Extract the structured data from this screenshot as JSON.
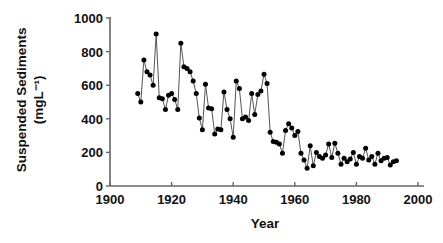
{
  "chart_data": {
    "type": "line",
    "title": "",
    "xlabel": "Year",
    "ylabel": "Suspended Sediments (mgL⁻¹)",
    "ylabel_line1": "Suspended Sediments",
    "ylabel_line2": "(mgL⁻¹)",
    "xlim": [
      1900,
      2000
    ],
    "ylim": [
      0,
      1000
    ],
    "xticks": [
      1900,
      1920,
      1940,
      1960,
      1980,
      2000
    ],
    "xtick_labels": [
      "1900",
      "1920",
      "1940",
      "1960",
      "1980",
      "2000"
    ],
    "yticks": [
      0,
      200,
      400,
      600,
      800,
      1000
    ],
    "ytick_labels": [
      "0",
      "200",
      "400",
      "600",
      "800",
      "1000"
    ],
    "grid": false,
    "legend": null,
    "marker": "filled-circle",
    "line_color": "#555555",
    "marker_color": "#000000",
    "axis_color": "#666666",
    "series": [
      {
        "name": "Suspended Sediments",
        "x": [
          1909,
          1910,
          1911,
          1912,
          1913,
          1914,
          1915,
          1916,
          1917,
          1918,
          1919,
          1920,
          1921,
          1922,
          1923,
          1924,
          1925,
          1926,
          1927,
          1928,
          1929,
          1930,
          1931,
          1932,
          1933,
          1934,
          1935,
          1936,
          1937,
          1938,
          1939,
          1940,
          1941,
          1942,
          1943,
          1944,
          1945,
          1946,
          1947,
          1948,
          1949,
          1950,
          1951,
          1952,
          1953,
          1954,
          1955,
          1956,
          1957,
          1958,
          1959,
          1960,
          1961,
          1962,
          1963,
          1964,
          1965,
          1966,
          1967,
          1968,
          1969,
          1970,
          1971,
          1972,
          1973,
          1974,
          1975,
          1976,
          1977,
          1978,
          1979,
          1980,
          1981,
          1982,
          1983,
          1984,
          1985,
          1986,
          1987,
          1988,
          1989,
          1990,
          1991,
          1992,
          1993
        ],
        "values": [
          550,
          500,
          750,
          680,
          660,
          600,
          905,
          525,
          520,
          455,
          540,
          550,
          515,
          455,
          850,
          710,
          700,
          680,
          625,
          550,
          405,
          335,
          605,
          465,
          460,
          310,
          340,
          335,
          560,
          455,
          400,
          290,
          625,
          580,
          400,
          410,
          390,
          550,
          425,
          545,
          565,
          665,
          610,
          320,
          265,
          260,
          250,
          195,
          330,
          370,
          345,
          300,
          325,
          195,
          155,
          105,
          240,
          120,
          200,
          175,
          165,
          185,
          250,
          170,
          255,
          195,
          130,
          165,
          145,
          160,
          200,
          130,
          175,
          165,
          225,
          155,
          175,
          130,
          195,
          150,
          165,
          170,
          125,
          145,
          150
        ]
      }
    ]
  },
  "axis": {
    "x_axis_name": "year-axis",
    "y_axis_name": "suspended-sediments-axis"
  }
}
